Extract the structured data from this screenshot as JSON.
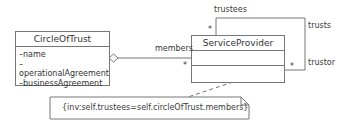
{
  "classes": {
    "circle_of_trust": {
      "name": "CircleOfTrust",
      "attributes": [
        "–name",
        "–operationalAgreement",
        "–businessAgreement"
      ]
    },
    "service_provider": {
      "name": "ServiceProvider",
      "attributes": [],
      "operations": []
    }
  },
  "associations": {
    "members": {
      "role": "members",
      "multiplicity": "*",
      "type": "aggregation"
    },
    "self": {
      "trustees_role": "trustees",
      "trustees_multiplicity": "*",
      "name": "trusts",
      "trustor_role": "trustor",
      "trustor_multiplicity": "*"
    }
  },
  "note": {
    "text": "{inv:self.trustees=self.circleOfTrust.members}"
  },
  "colors": {
    "line": "#777777",
    "text": "#3a3a3a",
    "background": "#ffffff"
  }
}
